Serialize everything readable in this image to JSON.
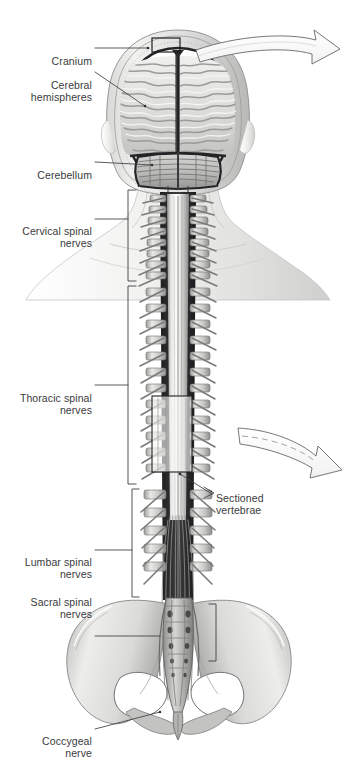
{
  "figure": {
    "background_color": "#ffffff",
    "text_color": "#3a3a3c",
    "width": 357,
    "height": 775
  },
  "labels": [
    {
      "id": "cranium",
      "text": "Cranium",
      "align": "right",
      "x": 16,
      "y": 42,
      "w": 76,
      "leader": {
        "x1": 95,
        "y1": 48,
        "x2": 148,
        "y2": 48,
        "type": "straight"
      }
    },
    {
      "id": "cerebral-hemispheres",
      "line1": "Cerebral",
      "line2": "hemispheres",
      "text": "Cerebral\nhemispheres",
      "align": "right",
      "x": 8,
      "y": 66,
      "w": 84,
      "leader": {
        "x1": 95,
        "y1": 72,
        "x2": 145,
        "y2": 106,
        "type": "straight"
      }
    },
    {
      "id": "cerebellum",
      "text": "Cerebellum",
      "align": "right",
      "x": 12,
      "y": 156,
      "w": 80,
      "leader": {
        "x1": 95,
        "y1": 162,
        "x2": 152,
        "y2": 165,
        "type": "straight"
      }
    },
    {
      "id": "cervical-spinal-nerves",
      "line1": "Cervical spinal",
      "line2": "nerves",
      "text": "Cervical spinal\nnerves",
      "align": "right",
      "x": 8,
      "y": 212,
      "w": 84,
      "leader": {
        "x1": 95,
        "y1": 219,
        "x2": 128,
        "y2": 219,
        "type": "straight"
      },
      "bracket": {
        "x": 128,
        "top": 190,
        "bottom": 281,
        "tick": 8
      }
    },
    {
      "id": "thoracic-spinal-nerves",
      "line1": "Thoracic spinal",
      "line2": "nerves",
      "text": "Thoracic spinal\nnerves",
      "align": "right",
      "x": 6,
      "y": 379,
      "w": 86,
      "second_line_faded": true,
      "leader": {
        "x1": 95,
        "y1": 385,
        "x2": 128,
        "y2": 385,
        "type": "straight"
      },
      "bracket": {
        "x": 128,
        "top": 286,
        "bottom": 484,
        "tick": 8
      }
    },
    {
      "id": "lumbar-spinal-nerves",
      "line1": "Lumbar spinal",
      "line2": "nerves",
      "text": "Lumbar spinal\nnerves",
      "align": "right",
      "x": 8,
      "y": 543,
      "w": 84,
      "leader": {
        "x1": 95,
        "y1": 550,
        "x2": 132,
        "y2": 550,
        "type": "straight"
      },
      "bracket": {
        "x": 132,
        "top": 489,
        "bottom": 597,
        "tick": 7
      }
    },
    {
      "id": "sacral-spinal-nerves",
      "line1": "Sacral spinal",
      "line2": "nerves",
      "text": "Sacral spinal\nnerves",
      "align": "right",
      "x": 12,
      "y": 583,
      "w": 80,
      "leader": {
        "x1": 95,
        "y1": 636,
        "x2": 160,
        "y2": 636,
        "type": "straight"
      },
      "bracket": {
        "x": 216,
        "top": 604,
        "bottom": 661,
        "tick": 7
      }
    },
    {
      "id": "coccygeal-nerve",
      "line1": "Coccygeal",
      "line2": "nerve",
      "text": "Coccygeal\nnerve",
      "align": "right",
      "x": 14,
      "y": 722,
      "w": 78,
      "leader": {
        "x1": 95,
        "y1": 729,
        "x2": 160,
        "y2": 712,
        "type": "straight"
      }
    },
    {
      "id": "sectioned-vertebrae",
      "line1": "Sectioned",
      "line2": "vertebrae",
      "text": "Sectioned\nvertebrae",
      "align": "left",
      "x": 216,
      "y": 479,
      "w": 84,
      "leader": {
        "x1": 212,
        "y1": 494,
        "x2": 180,
        "y2": 474,
        "type": "straight"
      }
    }
  ],
  "callout_boxes": [
    {
      "id": "cranium-detail-box",
      "x": 152,
      "y": 38,
      "w": 28,
      "h": 14
    },
    {
      "id": "sectioned-vertebrae-box",
      "x": 152,
      "y": 396,
      "w": 40,
      "h": 76
    }
  ],
  "arrows": [
    {
      "id": "magnify-arrow-top",
      "description": "large curved white outline arrow pointing right, from skull toward upper right",
      "style": "solid",
      "start": [
        196,
        52
      ],
      "end": [
        330,
        56
      ]
    },
    {
      "id": "magnify-arrow-middle",
      "description": "curved white outline arrow with dashed interior, from vertebrae box toward right",
      "style": "dashed-interior",
      "start": [
        240,
        430
      ],
      "end": [
        345,
        470
      ]
    }
  ],
  "anatomy": {
    "head": {
      "name": "coronal-section-of-head",
      "parts": [
        "cranium",
        "scalp",
        "dura-mater",
        "falx-cerebri",
        "cerebral-hemispheres",
        "cerebellum"
      ]
    },
    "body": {
      "name": "posterior-trunk-silhouette",
      "parts": [
        "neck",
        "shoulders",
        "pelvis",
        "sacrum",
        "coccyx",
        "ilium",
        "obturator-foramen"
      ]
    },
    "neural": {
      "name": "spinal-cord-and-nerves",
      "parts": [
        "spinal-cord",
        "dural-sac",
        "cervical-nerves",
        "thoracic-nerves",
        "lumbar-nerves",
        "sacral-nerves",
        "cauda-equina",
        "filum-terminale",
        "coccygeal-nerve"
      ]
    },
    "vertebral_segments": {
      "cervical_count": 8,
      "thoracic_count": 12,
      "lumbar_count": 5,
      "sacral_count": 5,
      "coccygeal_count": 1
    }
  },
  "palette": {
    "ink": "#3a3a3c",
    "leader_line": "#3f3f42",
    "bone_light": "#f2f2f0",
    "bone_mid": "#c9c9c6",
    "bone_dark": "#8d8d8a",
    "skin_light": "#f4f4f3",
    "skin_mid": "#dedede",
    "skin_shadow": "#c4c4c4",
    "dura_dark": "#2a2a2c",
    "cord_light": "#e8e8e6",
    "brain_light": "#efefed",
    "brain_mid": "#cfcfcd",
    "brain_dark": "#9a9a98",
    "arrow_outline": "#6f6f72",
    "arrow_fill": "#ffffff",
    "highlight_box": "#f5f5f3"
  }
}
